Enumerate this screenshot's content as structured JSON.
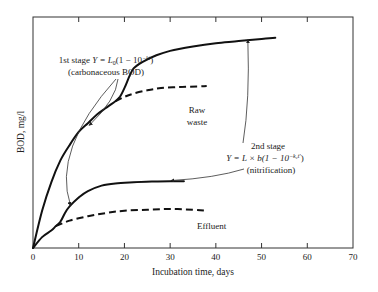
{
  "chart_data": {
    "type": "line",
    "title": "",
    "xlabel": "Incubation time, days",
    "ylabel": "BOD, mg/l",
    "xlim": [
      0,
      70
    ],
    "ylim": [
      0,
      100
    ],
    "xticks": [
      0,
      10,
      20,
      30,
      40,
      50,
      60,
      70
    ],
    "xtick_labels": [
      "0",
      "10",
      "20",
      "30",
      "40",
      "50",
      "60",
      "70"
    ],
    "yticks_labeled": false,
    "grid": false,
    "series": [
      {
        "name": "Raw waste (1st + 2nd stage)",
        "style": "solid",
        "x": [
          0,
          2,
          4,
          6,
          8,
          10,
          12,
          14,
          16,
          18,
          19,
          20,
          21,
          22,
          24,
          27,
          30,
          35,
          40,
          45,
          50,
          53
        ],
        "y": [
          0,
          17,
          30,
          40,
          47,
          53,
          57,
          61,
          64,
          67,
          69,
          73,
          78,
          82,
          85,
          88,
          90,
          92,
          93.5,
          94.5,
          95.5,
          96
        ]
      },
      {
        "name": "Raw waste (1st stage, carbonaceous)",
        "style": "dashed",
        "x": [
          18,
          20,
          22,
          25,
          28,
          32,
          36,
          38
        ],
        "y": [
          67,
          69,
          70.5,
          72,
          73,
          73.5,
          73.8,
          74
        ]
      },
      {
        "name": "Effluent (1st + 2nd stage)",
        "style": "solid",
        "x": [
          0,
          2,
          4,
          5,
          6,
          7,
          8,
          10,
          12,
          15,
          18,
          22,
          26,
          30,
          33
        ],
        "y": [
          0,
          5,
          8,
          10,
          12,
          16,
          19,
          23,
          26,
          28.5,
          29.5,
          30,
          30.3,
          30.5,
          30.5
        ]
      },
      {
        "name": "Effluent (1st stage, carbonaceous)",
        "style": "dashed",
        "x": [
          5,
          8,
          12,
          16,
          20,
          25,
          30,
          35,
          38
        ],
        "y": [
          10,
          12.5,
          14.5,
          16,
          17,
          17.5,
          17.8,
          17.5,
          17
        ]
      }
    ],
    "annotations": [
      {
        "id": "first_stage",
        "lines": [
          "1st stage Y = L₀(1 − 10⁻ᵏᵗ)",
          "(carbonaceous BOD)"
        ],
        "arrows_to": [
          "Raw waste curve near day 12",
          "Effluent curve near day 8"
        ]
      },
      {
        "id": "second_stage",
        "lines": [
          "2nd stage",
          "Y = L × b(1 − 10⁻ᵏ²ᵗ')",
          "(nitrification)"
        ],
        "arrows_to": [
          "Raw waste curve near day 47",
          "Effluent curve near day 30"
        ]
      },
      {
        "id": "raw_label",
        "lines": [
          "Raw",
          "waste"
        ]
      },
      {
        "id": "effluent_label",
        "lines": [
          "Effluent"
        ]
      }
    ]
  },
  "labels": {
    "xlabel": "Incubation time, days",
    "ylabel": "BOD, mg/l",
    "ann1_line1_prefix": "1st stage ",
    "ann1_eq": "Y = L",
    "ann1_sub": "0",
    "ann1_eq2": "(1 − 10",
    "ann1_sup": "−kt",
    "ann1_eq3": ")",
    "ann1_line2": "(carbonaceous BOD)",
    "ann2_line1": "2nd stage",
    "ann2_eq": "Y = L × b(1 − 10",
    "ann2_sup": "−k₂t'",
    "ann2_eq3": ")",
    "ann2_line3": "(nitrification)",
    "raw1": "Raw",
    "raw2": "waste",
    "effluent": "Effluent"
  }
}
